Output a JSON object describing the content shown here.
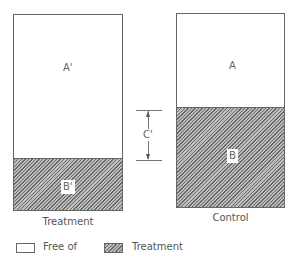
{
  "diagram": {
    "treatment_bar": {
      "caption": "Treatment",
      "upper_label": "A'",
      "lower_label": "B'"
    },
    "control_bar": {
      "caption": "Control",
      "upper_label": "A",
      "lower_label": "B"
    },
    "dimension": {
      "label": "C'"
    },
    "legend": {
      "items": [
        {
          "swatch": "empty",
          "label": "Free of"
        },
        {
          "swatch": "hatched",
          "label": "Treatment"
        }
      ]
    },
    "colors": {
      "outline": "#666666",
      "hatch_fill": "#bdbdbd",
      "hatch_line": "#6a6a6a",
      "background": "#ffffff"
    }
  }
}
